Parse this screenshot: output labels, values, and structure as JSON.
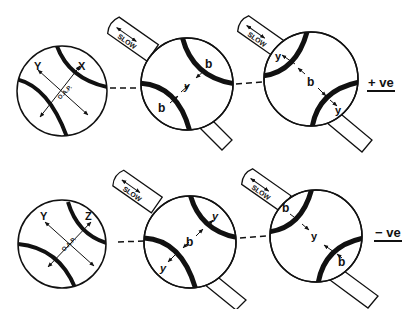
{
  "figure": {
    "rows": [
      {
        "sign_label": "+ ve",
        "panels": [
          {
            "type": "reference",
            "labels": {
              "upper_left": "Y",
              "upper_right": "X",
              "center": "O.A.P."
            }
          },
          {
            "type": "compensated",
            "compensator_label": "SLOW",
            "labels": {
              "a": "b",
              "b": "y",
              "c": "b"
            }
          },
          {
            "type": "compensated",
            "compensator_label": "SLOW",
            "labels": {
              "a": "y",
              "b": "b",
              "c": "y"
            }
          }
        ]
      },
      {
        "sign_label": "− ve",
        "panels": [
          {
            "type": "reference",
            "labels": {
              "upper_left": "Y",
              "upper_right": "Z",
              "center": "O.A.P."
            }
          },
          {
            "type": "compensated",
            "compensator_label": "SLOW",
            "labels": {
              "a": "y",
              "b": "b",
              "c": "y"
            }
          },
          {
            "type": "compensated",
            "compensator_label": "SLOW",
            "labels": {
              "a": "b",
              "b": "y",
              "c": "b"
            }
          }
        ]
      }
    ],
    "colors": {
      "ink": "#111111",
      "background": "#ffffff"
    }
  }
}
